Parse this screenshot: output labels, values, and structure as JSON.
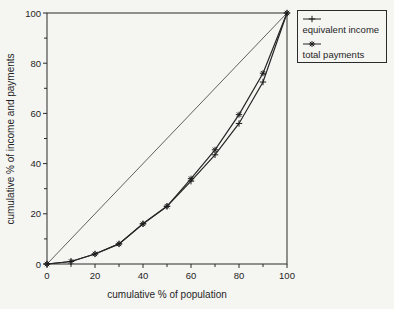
{
  "figure": {
    "background": "#f5f5f2",
    "ink": "#2b2b2b",
    "text_color": "#1f1f1f",
    "reference_line_color": "#4f4f4f"
  },
  "chart_data": {
    "type": "line",
    "title": "",
    "xlabel": "cumulative % of population",
    "ylabel": "cumulative % of income and payments",
    "xlim": [
      0,
      100
    ],
    "ylim": [
      0,
      100
    ],
    "x_major_ticks": [
      0,
      20,
      40,
      60,
      80,
      100
    ],
    "x_minor_ticks": [
      10,
      30,
      50,
      70,
      90
    ],
    "y_major_ticks": [
      0,
      20,
      40,
      60,
      80,
      100
    ],
    "y_minor_ticks": [
      10,
      30,
      50,
      70,
      90
    ],
    "grid": false,
    "legend_position": "top-right-outside",
    "x": [
      0,
      10,
      20,
      30,
      40,
      50,
      60,
      70,
      80,
      90,
      100
    ],
    "series": [
      {
        "name": "equivalent income",
        "marker": "plus",
        "values": [
          0,
          1,
          4,
          8,
          16,
          23,
          33,
          43.5,
          56,
          72.5,
          100
        ]
      },
      {
        "name": "total payments",
        "marker": "star",
        "values": [
          0,
          1,
          4,
          8,
          16,
          23,
          34,
          45.5,
          59.5,
          76,
          100
        ]
      }
    ],
    "reference_line": {
      "name": "line of equality",
      "from": [
        0,
        0
      ],
      "to": [
        100,
        100
      ]
    }
  }
}
